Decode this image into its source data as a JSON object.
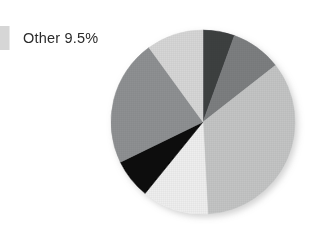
{
  "legend": {
    "swatch_color": "#d6d6d6",
    "label": "Other 9.5%"
  },
  "chart_data": {
    "type": "pie",
    "title": "",
    "subtitle": "",
    "xlabel": "",
    "ylabel": "",
    "grid": false,
    "legend_position": "top-left",
    "center": [
      203,
      122
    ],
    "radius": 92,
    "start_angle_deg": 0,
    "direction": "clockwise",
    "labels": [
      "Slice 1",
      "Slice 2",
      "Slice 3",
      "Slice 4",
      "Slice 5",
      "Slice 6",
      "Other 9.5%"
    ],
    "values": [
      5.6,
      8.9,
      34.7,
      11.7,
      6.9,
      22.7,
      9.5
    ],
    "angles_deg": [
      20,
      32,
      125,
      42,
      25,
      80,
      36
    ],
    "colors": [
      "#3d3f41",
      "#7c7e80",
      "#c3c4c4",
      "#eeeeee",
      "#070707",
      "#8e9092",
      "#d6d6d6"
    ],
    "annotations": [
      "Other 9.5%"
    ]
  }
}
